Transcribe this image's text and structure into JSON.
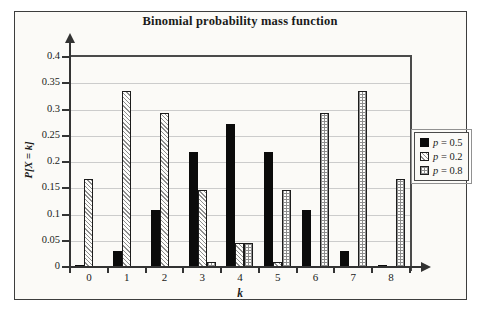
{
  "chart_data": {
    "type": "bar",
    "title": "Binomial probability mass function",
    "xlabel": "k",
    "ylabel": "P[X = k]",
    "categories": [
      "0",
      "1",
      "2",
      "3",
      "4",
      "5",
      "6",
      "7",
      "8"
    ],
    "series": [
      {
        "name": "p = 0.5",
        "pattern": "solid-black",
        "values": [
          0.004,
          0.031,
          0.109,
          0.219,
          0.273,
          0.219,
          0.109,
          0.031,
          0.004
        ]
      },
      {
        "name": "p = 0.2",
        "pattern": "diagonal-hatch",
        "values": [
          0.168,
          0.336,
          0.294,
          0.147,
          0.046,
          0.009,
          0,
          0,
          0
        ]
      },
      {
        "name": "p = 0.8",
        "pattern": "crosshatch",
        "values": [
          0,
          0,
          0,
          0.009,
          0.046,
          0.147,
          0.294,
          0.336,
          0.168
        ]
      }
    ],
    "ylim": [
      0,
      0.4
    ],
    "yticks": [
      "0",
      "0.05",
      "0.1",
      "0.15",
      "0.2",
      "0.25",
      "0.3",
      "0.35",
      "0.4"
    ],
    "grid": "horizontal",
    "legend_position": "right",
    "colors": {
      "bar_fill": "#0b0b0b",
      "hatch_line": "#8e8e8e",
      "grid_line": "#cccccc",
      "frame": "#4a4a4a",
      "background": "#fbfaf7"
    }
  }
}
